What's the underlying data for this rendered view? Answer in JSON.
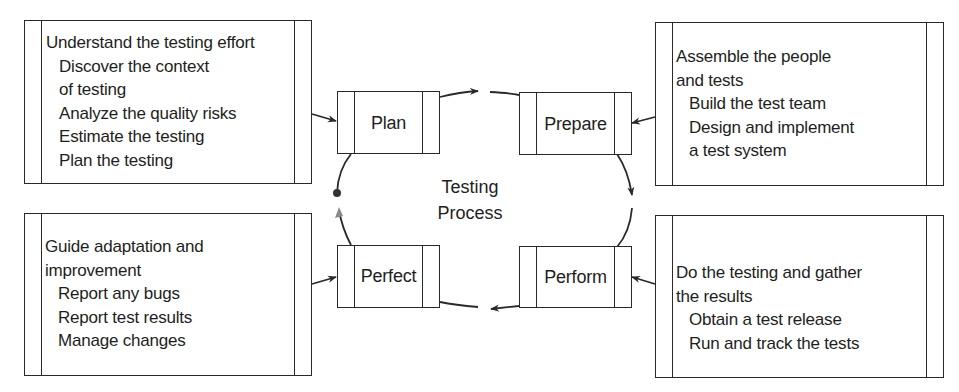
{
  "diagram": {
    "center_label": [
      "Testing",
      "Process"
    ],
    "stages": [
      {
        "id": "plan",
        "label": "Plan"
      },
      {
        "id": "prepare",
        "label": "Prepare"
      },
      {
        "id": "perform",
        "label": "Perform"
      },
      {
        "id": "perfect",
        "label": "Perfect"
      }
    ],
    "descriptions": {
      "plan": {
        "lines": [
          {
            "text": "Understand the testing effort",
            "indent": 0
          },
          {
            "text": "Discover the context",
            "indent": 1
          },
          {
            "text": "of testing",
            "indent": 1
          },
          {
            "text": "Analyze the quality risks",
            "indent": 1
          },
          {
            "text": "Estimate the testing",
            "indent": 1
          },
          {
            "text": "Plan the testing",
            "indent": 1
          }
        ]
      },
      "prepare": {
        "lines": [
          {
            "text": "Assemble the people",
            "indent": 0
          },
          {
            "text": "and tests",
            "indent": 0
          },
          {
            "text": "Build the test team",
            "indent": 1
          },
          {
            "text": "Design and implement",
            "indent": 1
          },
          {
            "text": "a test system",
            "indent": 1
          }
        ]
      },
      "perform": {
        "lines": [
          {
            "text": "Do the testing and gather",
            "indent": 0
          },
          {
            "text": "the results",
            "indent": 0
          },
          {
            "text": "Obtain a test release",
            "indent": 1
          },
          {
            "text": "Run and track the tests",
            "indent": 1
          }
        ]
      },
      "perfect": {
        "lines": [
          {
            "text": "Guide adaptation and",
            "indent": 0
          },
          {
            "text": "improvement",
            "indent": 0
          },
          {
            "text": "Report any bugs",
            "indent": 1
          },
          {
            "text": "Report test results",
            "indent": 1
          },
          {
            "text": "Manage changes",
            "indent": 1
          }
        ]
      }
    },
    "colors": {
      "stroke": "#2a2a2a",
      "text": "#1e1e1e",
      "start_marker": "#333333",
      "start_arrow": "#8a8a8a"
    }
  }
}
